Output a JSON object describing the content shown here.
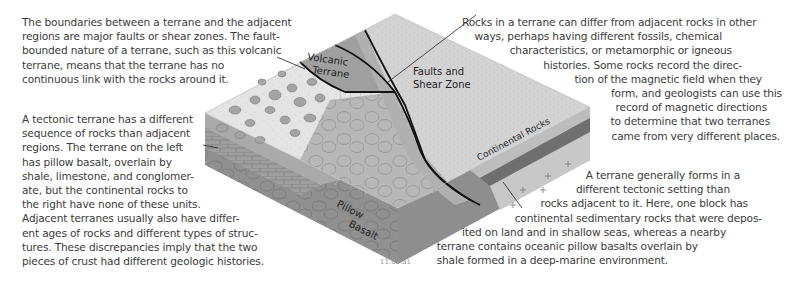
{
  "figure": {
    "id": "11.09.a1",
    "type": "block diagram"
  },
  "labels": {
    "volcanic_terrane": [
      "Volcanic",
      "Terrane"
    ],
    "faults": [
      "Faults and",
      "Shear Zone"
    ],
    "continental": "Continental Rocks",
    "pillow": [
      "Pillow",
      "Basalt"
    ]
  },
  "paragraphs": {
    "boundaries": [
      "The boundaries between a terrane and the adjacent",
      "regions are major faults or shear zones. The fault-",
      "bounded nature of a terrane, such as this volcanic",
      "terrane, means that the terrane has no",
      "continuous link with the rocks around it."
    ],
    "sequence": [
      "A tectonic terrane has a different",
      "sequence of rocks than adjacent",
      "regions. The terrane on the left",
      "has pillow basalt, overlain by",
      "shale, limestone, and conglomer-",
      "ate, but the continental rocks to",
      "the right have none of these units.",
      "Adjacent terranes usually also have differ-",
      "ent ages of rocks and different types of struc-",
      "tures. These discrepancies imply that the two",
      "pieces of crust had different geologic histories."
    ],
    "differ": [
      "Rocks in a terrane can differ from adjacent rocks in other",
      "ways, perhaps having different fossils, chemical",
      "characteristics, or metamorphic or igneous",
      "histories. Some rocks record the direc-",
      "tion of the magnetic field when they",
      "form, and geologists can use this",
      "record of magnetic directions",
      "to determine that two terranes",
      "came from very different places."
    ],
    "setting": [
      "A terrane generally forms in a",
      "different tectonic setting than",
      "rocks adjacent to it. Here, one block has",
      "continental sedimentary rocks that were depos-",
      "ited on land and in shallow seas, whereas a nearby",
      "terrane contains oceanic pillow basalts overlain by",
      "shale formed in a deep-marine environment."
    ]
  },
  "colors": {
    "text": "#3b3b3b",
    "top_continental": "#d6d6d6",
    "volcanic": "#9e9e9e",
    "conglomerate": "#e2e2e2",
    "pillow_face": "#8a8a8a",
    "fault_line": "#111111"
  }
}
